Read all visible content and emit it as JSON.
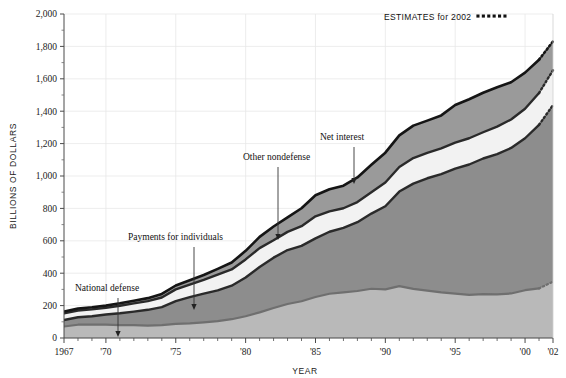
{
  "chart_data": {
    "type": "area",
    "title": "",
    "subtitle": "",
    "xlabel": "YEAR",
    "ylabel": "BILLIONS OF DOLLARS",
    "xlim": [
      1967,
      2002
    ],
    "ylim": [
      0,
      2000
    ],
    "grid": true,
    "stacked": true,
    "legend_position": "top-right",
    "annotation_note": "ESTIMATES for 2002",
    "note_marker": "dotted",
    "ytick_labels": [
      "0",
      "200",
      "400",
      "600",
      "800",
      "1,000",
      "1,200",
      "1,400",
      "1,600",
      "1,800",
      "2,000"
    ],
    "ytick_values": [
      0,
      200,
      400,
      600,
      800,
      1000,
      1200,
      1400,
      1600,
      1800,
      2000
    ],
    "xtick_labels": [
      "1967",
      "'70",
      "'75",
      "'80",
      "'85",
      "'90",
      "'95",
      "'00",
      "'02"
    ],
    "xtick_values": [
      1967,
      1970,
      1975,
      1980,
      1985,
      1990,
      1995,
      2000,
      2002
    ],
    "x": [
      1967,
      1968,
      1969,
      1970,
      1971,
      1972,
      1973,
      1974,
      1975,
      1976,
      1977,
      1978,
      1979,
      1980,
      1981,
      1982,
      1983,
      1984,
      1985,
      1986,
      1987,
      1988,
      1989,
      1990,
      1991,
      1992,
      1993,
      1994,
      1995,
      1996,
      1997,
      1998,
      1999,
      2000,
      2001,
      2002
    ],
    "series": [
      {
        "name": "National defense",
        "color": "#b9b9b9",
        "values": [
          71,
          82,
          82,
          82,
          79,
          79,
          77,
          79,
          87,
          90,
          97,
          104,
          116,
          134,
          158,
          185,
          210,
          227,
          253,
          273,
          282,
          290,
          304,
          300,
          320,
          303,
          292,
          282,
          274,
          266,
          271,
          269,
          275,
          295,
          306,
          348
        ]
      },
      {
        "name": "Payments for individuals",
        "color": "#8d8d8d",
        "values": [
          40,
          46,
          52,
          63,
          74,
          84,
          97,
          112,
          141,
          162,
          177,
          190,
          207,
          239,
          280,
          311,
          333,
          342,
          362,
          383,
          398,
          425,
          464,
          513,
          584,
          650,
          694,
          729,
          772,
          805,
          837,
          866,
          898,
          938,
          1010,
          1090
        ]
      },
      {
        "name": "Other nondefense",
        "color": "#f2f2f2",
        "values": [
          41,
          42,
          43,
          41,
          46,
          51,
          54,
          59,
          72,
          78,
          85,
          97,
          100,
          112,
          117,
          107,
          112,
          121,
          136,
          126,
          121,
          124,
          132,
          147,
          152,
          158,
          157,
          160,
          160,
          162,
          162,
          170,
          176,
          182,
          196,
          215
        ]
      },
      {
        "name": "Net interest",
        "color": "#9a9a9a",
        "values": [
          11,
          12,
          13,
          14,
          15,
          16,
          18,
          22,
          24,
          27,
          30,
          36,
          43,
          53,
          69,
          85,
          90,
          111,
          130,
          136,
          139,
          152,
          169,
          184,
          195,
          200,
          199,
          203,
          232,
          241,
          244,
          243,
          230,
          223,
          206,
          178
        ]
      }
    ],
    "totals_note": "Values are stacked; topmost boundary is total outlays.",
    "annotations": [
      {
        "label": "National defense",
        "label_x": 75,
        "label_y": 291,
        "arrow_x": 118,
        "arrow_y0": 298,
        "arrow_y1": 337
      },
      {
        "label": "Payments for individuals",
        "label_x": 128,
        "label_y": 240,
        "arrow_x": 194,
        "arrow_y0": 247,
        "arrow_y1": 310
      },
      {
        "label": "Other nondefense",
        "label_x": 243,
        "label_y": 160,
        "arrow_x": 278,
        "arrow_y0": 167,
        "arrow_y1": 240
      },
      {
        "label": "Net interest",
        "label_x": 320,
        "label_y": 140,
        "arrow_x": 354,
        "arrow_y0": 147,
        "arrow_y1": 184
      }
    ]
  }
}
